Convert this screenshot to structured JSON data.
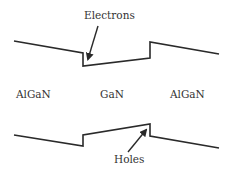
{
  "diagram": {
    "type": "band-diagram",
    "line_color": "#2a2a2a",
    "text_color": "#333333",
    "annotations": {
      "top": "Electrons",
      "bottom": "Holes"
    },
    "regions": [
      {
        "label": "AlGaN"
      },
      {
        "label": "GaN"
      },
      {
        "label": "AlGaN"
      }
    ],
    "conduction_band_points": [
      [
        14,
        41
      ],
      [
        83,
        53
      ],
      [
        83,
        66
      ],
      [
        150,
        58
      ],
      [
        150,
        42
      ],
      [
        219,
        54
      ]
    ],
    "valence_band_points": [
      [
        14,
        135
      ],
      [
        83,
        146
      ],
      [
        83,
        135
      ],
      [
        150,
        124
      ],
      [
        150,
        136
      ],
      [
        219,
        148
      ]
    ]
  }
}
